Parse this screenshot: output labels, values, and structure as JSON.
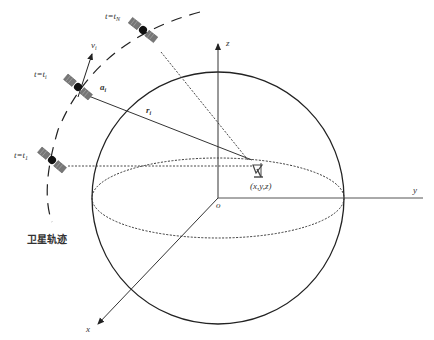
{
  "figure": {
    "type": "satellite-positioning-geometry",
    "colors": {
      "line": "#333333",
      "background": "#ffffff"
    }
  },
  "axes": {
    "origin_label": "o",
    "x_label": "x",
    "y_label": "y",
    "z_label": "z"
  },
  "receiver": {
    "icon": "antenna-icon",
    "position_label": "(x,y,z)"
  },
  "satellites": [
    {
      "id": "sat-N",
      "time_label_t": "t=t",
      "time_label_sub": "N"
    },
    {
      "id": "sat-i",
      "time_label_t": "t=t",
      "time_label_sub": "i"
    },
    {
      "id": "sat-1",
      "time_label_t": "t=t",
      "time_label_sub": "1"
    }
  ],
  "vectors": {
    "velocity_label": "v",
    "velocity_sub": "i",
    "acceleration_label": "a",
    "acceleration_sub": "i",
    "range_label": "r",
    "range_sub": "i"
  },
  "orbit": {
    "label": "卫星轨迹"
  }
}
